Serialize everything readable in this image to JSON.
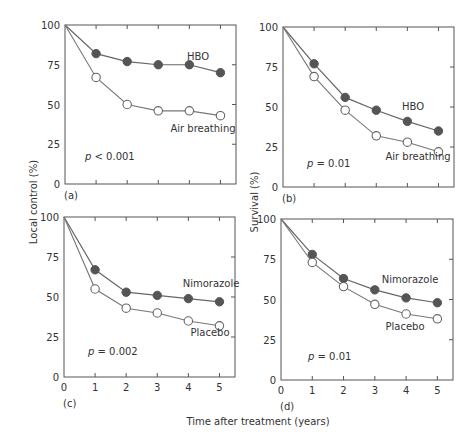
{
  "figure": {
    "xlabel": "Time after treatment (years)",
    "ylabel_left": "Local control (%)",
    "ylabel_right": "Survival (%)"
  },
  "chart_data": [
    {
      "type": "line",
      "panel": "(a)",
      "ylabel": "Local control (%)",
      "xlabel": "Time after treatment (years)",
      "x": [
        0,
        1,
        2,
        3,
        4,
        5
      ],
      "xlim": [
        0,
        5.5
      ],
      "ylim": [
        0,
        100
      ],
      "xticks": [
        "0",
        "1",
        "2",
        "3",
        "4",
        "5"
      ],
      "yticks": [
        "0",
        "25",
        "50",
        "75",
        "100"
      ],
      "show_xtick_labels": false,
      "pvalue": {
        "symbol": "p",
        "text": " < 0.001"
      },
      "series": [
        {
          "name": "HBO",
          "marker": "filled",
          "values": [
            100,
            82,
            77,
            75,
            75,
            70
          ]
        },
        {
          "name": "Air breathing",
          "marker": "open",
          "values": [
            100,
            67,
            50,
            46,
            46,
            43
          ]
        }
      ]
    },
    {
      "type": "line",
      "panel": "(b)",
      "ylabel": "Survival (%)",
      "xlabel": "Time after treatment (years)",
      "x": [
        0,
        1,
        2,
        3,
        4,
        5
      ],
      "xlim": [
        0,
        5.5
      ],
      "ylim": [
        0,
        100
      ],
      "xticks": [
        "0",
        "1",
        "2",
        "3",
        "4",
        "5"
      ],
      "yticks": [
        "0",
        "25",
        "50",
        "75",
        "100"
      ],
      "show_xtick_labels": false,
      "pvalue": {
        "symbol": "p",
        "text": " = 0.01"
      },
      "series": [
        {
          "name": "HBO",
          "marker": "filled",
          "values": [
            100,
            77,
            56,
            48,
            41,
            35
          ]
        },
        {
          "name": "Air breathing",
          "marker": "open",
          "values": [
            100,
            69,
            48,
            32,
            28,
            22
          ]
        }
      ]
    },
    {
      "type": "line",
      "panel": "(c)",
      "ylabel": "Local control (%)",
      "xlabel": "Time after treatment (years)",
      "x": [
        0,
        1,
        2,
        3,
        4,
        5
      ],
      "xlim": [
        0,
        5.5
      ],
      "ylim": [
        0,
        100
      ],
      "xticks": [
        "0",
        "1",
        "2",
        "3",
        "4",
        "5"
      ],
      "yticks": [
        "0",
        "25",
        "50",
        "75",
        "100"
      ],
      "show_xtick_labels": true,
      "pvalue": {
        "symbol": "p",
        "text": " = 0.002"
      },
      "series": [
        {
          "name": "Nimorazole",
          "marker": "filled",
          "values": [
            100,
            67,
            53,
            51,
            49,
            47
          ]
        },
        {
          "name": "Placebo",
          "marker": "open",
          "values": [
            100,
            55,
            43,
            40,
            35,
            32
          ]
        }
      ]
    },
    {
      "type": "line",
      "panel": "(d)",
      "ylabel": "Survival (%)",
      "xlabel": "Time after treatment (years)",
      "x": [
        0,
        1,
        2,
        3,
        4,
        5
      ],
      "xlim": [
        0,
        5.5
      ],
      "ylim": [
        0,
        100
      ],
      "xticks": [
        "0",
        "1",
        "2",
        "3",
        "4",
        "5"
      ],
      "yticks": [
        "0",
        "25",
        "50",
        "75",
        "100"
      ],
      "show_xtick_labels": true,
      "pvalue": {
        "symbol": "p",
        "text": " = 0.01"
      },
      "series": [
        {
          "name": "Nimorazole",
          "marker": "filled",
          "values": [
            100,
            78,
            63,
            56,
            51,
            48
          ]
        },
        {
          "name": "Placebo",
          "marker": "open",
          "values": [
            100,
            73,
            58,
            47,
            41,
            38
          ]
        }
      ]
    }
  ]
}
